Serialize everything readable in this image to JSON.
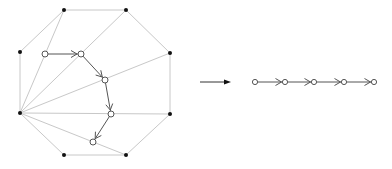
{
  "diagram": {
    "colors": {
      "edge": "#c8c8c8",
      "path": "#555555",
      "vertex": "#111111",
      "node_fill": "#ffffff",
      "node_stroke": "#555555"
    },
    "octagon": {
      "vertices": [
        {
          "id": "v0",
          "x": 64,
          "y": 10
        },
        {
          "id": "v1",
          "x": 126,
          "y": 10
        },
        {
          "id": "v2",
          "x": 170,
          "y": 53
        },
        {
          "id": "v3",
          "x": 170,
          "y": 114
        },
        {
          "id": "v4",
          "x": 126,
          "y": 155
        },
        {
          "id": "v5",
          "x": 64,
          "y": 155
        },
        {
          "id": "v6",
          "x": 20,
          "y": 113
        },
        {
          "id": "v7",
          "x": 20,
          "y": 52
        }
      ],
      "diagonals": [
        {
          "from": "v6",
          "to": "v0"
        },
        {
          "from": "v6",
          "to": "v1"
        },
        {
          "from": "v6",
          "to": "v2"
        },
        {
          "from": "v6",
          "to": "v3"
        },
        {
          "from": "v6",
          "to": "v4"
        }
      ]
    },
    "dual_path": {
      "nodes": [
        {
          "id": "n1",
          "x": 45,
          "y": 54
        },
        {
          "id": "n2",
          "x": 81,
          "y": 54
        },
        {
          "id": "n3",
          "x": 105,
          "y": 80
        },
        {
          "id": "n4",
          "x": 111,
          "y": 114
        },
        {
          "id": "n5",
          "x": 93,
          "y": 142
        }
      ],
      "edges": [
        {
          "from": "n1",
          "to": "n2"
        },
        {
          "from": "n2",
          "to": "n3"
        },
        {
          "from": "n3",
          "to": "n4"
        },
        {
          "from": "n4",
          "to": "n5"
        }
      ]
    },
    "transform_arrow": {
      "x1": 200,
      "y1": 82,
      "x2": 231,
      "y2": 82
    },
    "chain": {
      "nodes": [
        {
          "id": "c1",
          "x": 255,
          "y": 82
        },
        {
          "id": "c2",
          "x": 285,
          "y": 82
        },
        {
          "id": "c3",
          "x": 314,
          "y": 82
        },
        {
          "id": "c4",
          "x": 344,
          "y": 82
        },
        {
          "id": "c5",
          "x": 374,
          "y": 82
        }
      ]
    }
  }
}
